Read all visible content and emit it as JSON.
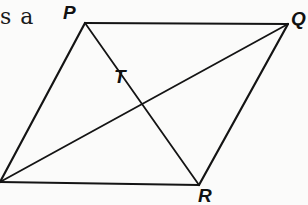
{
  "text_fragment": "s a",
  "figure": {
    "shape": "parallelogram",
    "stroke_color": "#141414",
    "background_color": "#fbfbfa",
    "vertices": {
      "P": {
        "label": "P",
        "x": 85,
        "y": 23
      },
      "Q": {
        "label": "Q",
        "x": 288,
        "y": 24
      },
      "R": {
        "label": "R",
        "x": 199,
        "y": 185
      },
      "S": {
        "label": "",
        "x": 0,
        "y": 182
      }
    },
    "intersection": {
      "label": "T",
      "x": 143,
      "y": 77
    },
    "edges": [
      [
        "P",
        "Q"
      ],
      [
        "Q",
        "R"
      ],
      [
        "R",
        "S"
      ],
      [
        "S",
        "P"
      ]
    ],
    "diagonals": [
      [
        "P",
        "R"
      ],
      [
        "S",
        "Q"
      ]
    ]
  }
}
